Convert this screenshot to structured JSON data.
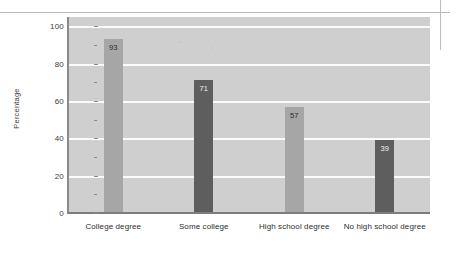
{
  "chart_data": {
    "type": "bar",
    "title": "",
    "xlabel": "",
    "ylabel": "Percentage",
    "ylim": [
      0,
      105
    ],
    "yticks": [
      0,
      20,
      40,
      60,
      80,
      100
    ],
    "ytick_labels": [
      "0",
      "20",
      "40",
      "60",
      "80",
      "100"
    ],
    "grid": true,
    "legend": "none",
    "categories": [
      "College degree",
      "Some college",
      "High school degree",
      "No high school degree"
    ],
    "values": [
      93,
      71,
      57,
      39
    ],
    "value_labels": [
      "93",
      "71",
      "57",
      "39"
    ],
    "bar_colors": [
      "#a6a6a6",
      "#5e5e5e",
      "#a6a6a6",
      "#5e5e5e"
    ],
    "plot_background": "#cfcfcf",
    "gridline_color": "#fbfbfb",
    "axis_color": "#7c7c7c"
  }
}
